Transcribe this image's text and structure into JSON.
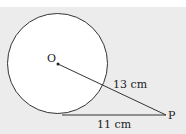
{
  "diagram": {
    "center_label": "O",
    "point_label": "P",
    "hypotenuse_label": "13 cm",
    "tangent_label": "11 cm",
    "colors": {
      "background": "#ececec",
      "circle_fill": "#ffffff",
      "stroke": "#333333"
    }
  }
}
